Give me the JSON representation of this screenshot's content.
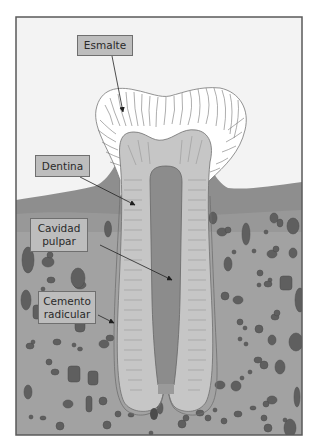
{
  "diagram": {
    "colors": {
      "background": "#f3f3f3",
      "frame": "#5a5a5a",
      "gum": "#8f8f8f",
      "gum_light": "#9c9c9c",
      "bone": "#a4a4a4",
      "enamel": "#ffffff",
      "dentin": "#c4c4c4",
      "pulp": "#8a8a8a",
      "cementum": "#d8d8d8",
      "rocks": "#5e5e5e",
      "label_fill": "#bdbdbd"
    },
    "labels": [
      {
        "id": "esmalte",
        "lines": [
          "Esmalte"
        ]
      },
      {
        "id": "dentina",
        "lines": [
          "Dentina"
        ]
      },
      {
        "id": "cavidad-pulpar",
        "lines": [
          "Cavidad",
          "pulpar"
        ]
      },
      {
        "id": "cemento-radicular",
        "lines": [
          "Cemento",
          "radicular"
        ]
      }
    ]
  }
}
